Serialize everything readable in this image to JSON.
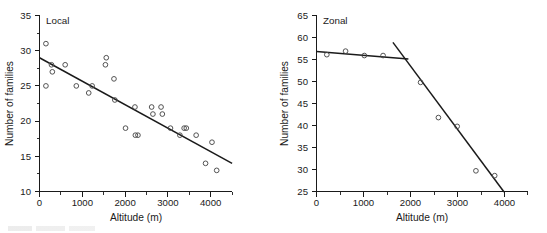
{
  "figure": {
    "background": "#ffffff",
    "marker_color": "#4a4a4a",
    "line_color": "#1a1a1a",
    "text_color": "#1a1a1a"
  },
  "chart_data": [
    {
      "type": "scatter",
      "panel_id": "local",
      "title": "Local",
      "xlabel": "Altitude (m)",
      "ylabel": "Number of families",
      "xlim": [
        0,
        4500
      ],
      "ylim": [
        10,
        35
      ],
      "xticks": [
        0,
        1000,
        2000,
        3000,
        4000
      ],
      "xtick_labels": [
        "0",
        "1000",
        "2000",
        "3000",
        "4000"
      ],
      "xticks_minor": [
        500,
        1500,
        2500,
        3500,
        4500
      ],
      "yticks": [
        10,
        15,
        20,
        25,
        30,
        35
      ],
      "ytick_labels": [
        "10",
        "15",
        "20",
        "25",
        "30",
        "35"
      ],
      "yticks_minor": [
        12.5,
        17.5,
        22.5,
        27.5,
        32.5
      ],
      "grid": false,
      "legend": "none",
      "marker": "open-circle",
      "points": [
        [
          150,
          31
        ],
        [
          150,
          25
        ],
        [
          280,
          28
        ],
        [
          300,
          27
        ],
        [
          600,
          28
        ],
        [
          860,
          25
        ],
        [
          1150,
          24
        ],
        [
          1230,
          25
        ],
        [
          1560,
          29
        ],
        [
          1540,
          28
        ],
        [
          1740,
          26
        ],
        [
          1760,
          23
        ],
        [
          2010,
          19
        ],
        [
          2230,
          22
        ],
        [
          2240,
          18
        ],
        [
          2300,
          18
        ],
        [
          2620,
          22
        ],
        [
          2650,
          21
        ],
        [
          2840,
          22
        ],
        [
          2870,
          21
        ],
        [
          3060,
          19
        ],
        [
          3280,
          18
        ],
        [
          3380,
          19
        ],
        [
          3430,
          19
        ],
        [
          3660,
          18
        ],
        [
          3880,
          14
        ],
        [
          4030,
          17
        ],
        [
          4140,
          13
        ]
      ],
      "fit_lines": [
        {
          "name": "linear-regression",
          "from": [
            0,
            29.0
          ],
          "to": [
            4500,
            14.0
          ]
        }
      ]
    },
    {
      "type": "scatter",
      "panel_id": "zonal",
      "title": "Zonal",
      "xlabel": "Altitude (m)",
      "ylabel": "Number of families",
      "xlim": [
        0,
        4500
      ],
      "ylim": [
        25,
        65
      ],
      "xticks": [
        0,
        1000,
        2000,
        3000,
        4000
      ],
      "xtick_labels": [
        "0",
        "1000",
        "2000",
        "3000",
        "4000"
      ],
      "xticks_minor": [
        500,
        1500,
        2500,
        3500,
        4500
      ],
      "yticks": [
        25,
        30,
        35,
        40,
        45,
        50,
        55,
        60,
        65
      ],
      "ytick_labels": [
        "25",
        "30",
        "35",
        "40",
        "45",
        "50",
        "55",
        "60",
        "65"
      ],
      "grid": false,
      "legend": "none",
      "marker": "open-circle",
      "points": [
        [
          220,
          56.1
        ],
        [
          620,
          56.9
        ],
        [
          1020,
          55.9
        ],
        [
          1420,
          55.9
        ],
        [
          2220,
          49.8
        ],
        [
          2600,
          41.8
        ],
        [
          3000,
          39.8
        ],
        [
          3400,
          29.7
        ],
        [
          3800,
          28.6
        ]
      ],
      "fit_lines": [
        {
          "name": "plateau-segment",
          "from": [
            0,
            56.8
          ],
          "to": [
            1960,
            55.1
          ]
        },
        {
          "name": "decline-segment",
          "from": [
            1630,
            58.9
          ],
          "to": [
            4000,
            24.9
          ]
        }
      ]
    }
  ]
}
